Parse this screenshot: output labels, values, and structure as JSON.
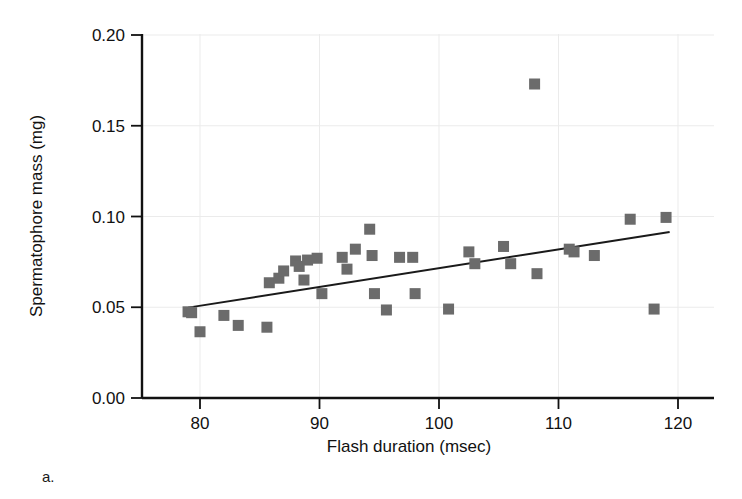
{
  "figure": {
    "panel_label": "a.",
    "background_color": "#ffffff"
  },
  "chart_data": {
    "type": "scatter",
    "title": "",
    "xlabel": "Flash duration (msec)",
    "ylabel": "Spermatophore mass (mg)",
    "xlim": [
      75,
      122
    ],
    "ylim": [
      0.0,
      0.2
    ],
    "xticks": [
      80,
      90,
      100,
      110,
      120
    ],
    "xtick_labels": [
      "80",
      "90",
      "100",
      "110",
      "120"
    ],
    "yticks": [
      0.0,
      0.05,
      0.1,
      0.15,
      0.2
    ],
    "ytick_labels": [
      "0.00",
      "0.05",
      "0.10",
      "0.15",
      "0.20"
    ],
    "grid": true,
    "grid_color": "#ebebeb",
    "legend": null,
    "marker": {
      "shape": "square",
      "color": "#6b6b6b",
      "size_px": 11
    },
    "trendline": {
      "type": "linear-regression",
      "color": "#1a1a1a",
      "width_px": 2,
      "x_start": 79.0,
      "y_start": 0.0498,
      "x_end": 119.3,
      "y_end": 0.0915
    },
    "x": [
      79.0,
      79.3,
      80.0,
      82.0,
      83.2,
      85.6,
      85.8,
      86.6,
      87.0,
      88.0,
      88.3,
      88.7,
      89.0,
      89.8,
      90.2,
      91.9,
      92.3,
      93.0,
      94.2,
      94.4,
      94.6,
      95.6,
      96.7,
      97.8,
      98.0,
      100.8,
      102.5,
      103.0,
      105.4,
      106.0,
      108.0,
      108.2,
      110.9,
      111.3,
      113.0,
      116.0,
      118.0,
      119.0
    ],
    "y": [
      0.0475,
      0.047,
      0.0365,
      0.0455,
      0.04,
      0.039,
      0.0635,
      0.066,
      0.07,
      0.0755,
      0.0725,
      0.065,
      0.076,
      0.077,
      0.0575,
      0.0775,
      0.071,
      0.082,
      0.093,
      0.0785,
      0.0575,
      0.0485,
      0.0775,
      0.0775,
      0.0575,
      0.049,
      0.0805,
      0.074,
      0.0835,
      0.074,
      0.173,
      0.0685,
      0.082,
      0.0805,
      0.0785,
      0.0985,
      0.049,
      0.0995
    ],
    "points": [
      {
        "x": 79.0,
        "y": 0.0475
      },
      {
        "x": 79.3,
        "y": 0.047
      },
      {
        "x": 80.0,
        "y": 0.0365
      },
      {
        "x": 82.0,
        "y": 0.0455
      },
      {
        "x": 83.2,
        "y": 0.04
      },
      {
        "x": 85.6,
        "y": 0.039
      },
      {
        "x": 85.8,
        "y": 0.0635
      },
      {
        "x": 86.6,
        "y": 0.066
      },
      {
        "x": 87.0,
        "y": 0.07
      },
      {
        "x": 88.0,
        "y": 0.0755
      },
      {
        "x": 88.3,
        "y": 0.0725
      },
      {
        "x": 88.7,
        "y": 0.065
      },
      {
        "x": 89.0,
        "y": 0.076
      },
      {
        "x": 89.8,
        "y": 0.077
      },
      {
        "x": 90.2,
        "y": 0.0575
      },
      {
        "x": 91.9,
        "y": 0.0775
      },
      {
        "x": 92.3,
        "y": 0.071
      },
      {
        "x": 93.0,
        "y": 0.082
      },
      {
        "x": 94.2,
        "y": 0.093
      },
      {
        "x": 94.4,
        "y": 0.0785
      },
      {
        "x": 94.6,
        "y": 0.0575
      },
      {
        "x": 95.6,
        "y": 0.0485
      },
      {
        "x": 96.7,
        "y": 0.0775
      },
      {
        "x": 97.8,
        "y": 0.0775
      },
      {
        "x": 98.0,
        "y": 0.0575
      },
      {
        "x": 100.8,
        "y": 0.049
      },
      {
        "x": 102.5,
        "y": 0.0805
      },
      {
        "x": 103.0,
        "y": 0.074
      },
      {
        "x": 105.4,
        "y": 0.0835
      },
      {
        "x": 106.0,
        "y": 0.074
      },
      {
        "x": 108.0,
        "y": 0.173
      },
      {
        "x": 108.2,
        "y": 0.0685
      },
      {
        "x": 110.9,
        "y": 0.082
      },
      {
        "x": 111.3,
        "y": 0.0805
      },
      {
        "x": 113.0,
        "y": 0.0785
      },
      {
        "x": 116.0,
        "y": 0.0985
      },
      {
        "x": 118.0,
        "y": 0.049
      },
      {
        "x": 119.0,
        "y": 0.0995
      }
    ]
  }
}
